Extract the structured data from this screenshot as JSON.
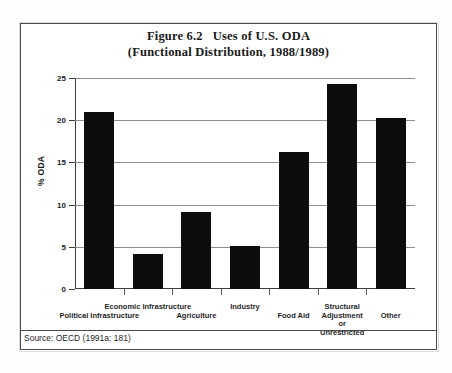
{
  "figure": {
    "title_line1_number": "Figure 6.2",
    "title_line1_text": "Uses of U.S. ODA",
    "title_line2": "(Functional Distribution, 1988/1989)",
    "source_note": "Source: OECD (1991a: 181)"
  },
  "chart_data": {
    "type": "bar",
    "xlabel": "",
    "ylabel": "% ODA",
    "ylim": [
      0,
      25
    ],
    "yticks": [
      0,
      5,
      10,
      15,
      20,
      25
    ],
    "ytick_labels": [
      "0",
      "5",
      "10",
      "15",
      "20",
      "25"
    ],
    "grid": true,
    "legend": "none",
    "bar_color": "#0d0d0d",
    "categories": [
      "Political Infrastructure",
      "Economic Infrastructure",
      "Agriculture",
      "Industry",
      "Food Aid",
      "Structural Adjustment or Unrestricted",
      "Other"
    ],
    "category_label_lines": [
      [
        "Political Infrastructure"
      ],
      [
        "Economic Infrastructure"
      ],
      [
        "Agriculture"
      ],
      [
        "Industry"
      ],
      [
        "Food Aid"
      ],
      [
        "Structural",
        "Adjustment",
        "or",
        "Unrestricted"
      ],
      [
        "Other"
      ]
    ],
    "values": [
      21.0,
      4.1,
      9.1,
      5.1,
      16.2,
      24.3,
      20.3
    ]
  }
}
